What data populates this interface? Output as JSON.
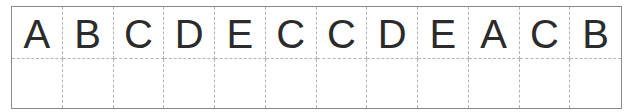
{
  "worksheet": {
    "letters": [
      "A",
      "B",
      "C",
      "D",
      "E",
      "C",
      "C",
      "D",
      "E",
      "A",
      "C",
      "B"
    ],
    "answer_cells": [
      "",
      "",
      "",
      "",
      "",
      "",
      "",
      "",
      "",
      "",
      "",
      ""
    ],
    "colors": {
      "letter": "#2b2b2b",
      "outer_border": "#8a8a8a",
      "dashed_lines": "#b4b4b4",
      "background": "#ffffff"
    }
  }
}
